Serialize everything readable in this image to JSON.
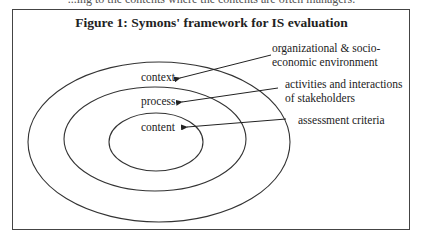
{
  "page": {
    "clipped_top_text": "...ing to the contents where the contents are often managers."
  },
  "figure": {
    "title": "Figure 1: Symons' framework for IS evaluation",
    "rings": [
      {
        "name": "context",
        "label": "context"
      },
      {
        "name": "process",
        "label": "process"
      },
      {
        "name": "content",
        "label": "content"
      }
    ],
    "annotations": [
      {
        "target": "context",
        "lines": [
          "organizational & socio-",
          "economic environment"
        ]
      },
      {
        "target": "process",
        "lines": [
          "activities and interactions",
          "of  stakeholders"
        ]
      },
      {
        "target": "content",
        "lines": [
          "assessment criteria"
        ]
      }
    ],
    "colors": {
      "stroke": "#333333",
      "text": "#222222"
    }
  }
}
